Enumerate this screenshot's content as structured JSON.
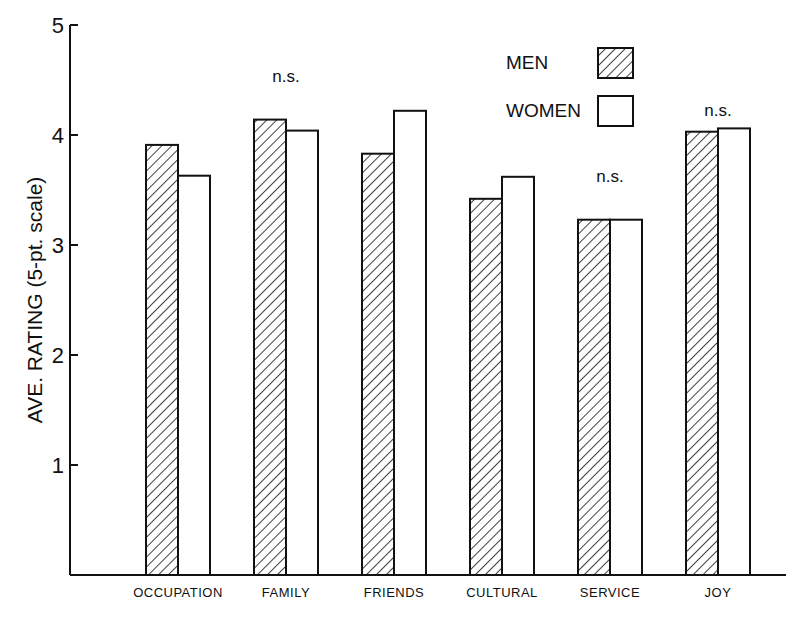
{
  "chart_data": {
    "type": "bar",
    "title": "",
    "xlabel": "",
    "ylabel": "AVE. RATING (5-pt. scale)",
    "ylim": [
      0,
      5
    ],
    "yticks": [
      "1",
      "2",
      "3",
      "4",
      "5"
    ],
    "grid": false,
    "legend_position": "top-right",
    "categories": [
      "OCCUPATION",
      "FAMILY",
      "FRIENDS",
      "CULTURAL",
      "SERVICE",
      "JOY"
    ],
    "series": [
      {
        "name": "MEN",
        "pattern": "hatched",
        "values": [
          3.91,
          4.14,
          3.83,
          3.42,
          3.23,
          4.03
        ]
      },
      {
        "name": "WOMEN",
        "pattern": "open",
        "values": [
          3.63,
          4.04,
          4.22,
          3.62,
          3.23,
          4.06
        ]
      }
    ],
    "annotations": [
      {
        "category": "FAMILY",
        "text": "n.s."
      },
      {
        "category": "SERVICE",
        "text": "n.s."
      },
      {
        "category": "JOY",
        "text": "n.s."
      }
    ]
  }
}
